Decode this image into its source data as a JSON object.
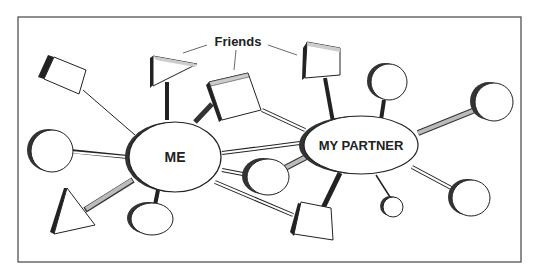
{
  "diagram": {
    "type": "social network diagram",
    "labels": {
      "me": "ME",
      "partner": "MY PARTNER",
      "friends": "Friends"
    },
    "nodes": [
      {
        "id": "me",
        "shape": "ellipse",
        "label": "ME"
      },
      {
        "id": "partner",
        "shape": "ellipse",
        "label": "MY PARTNER"
      },
      {
        "id": "friend-triangle-top",
        "shape": "triangle"
      },
      {
        "id": "friend-box-center",
        "shape": "box"
      },
      {
        "id": "friend-box-top-right",
        "shape": "box"
      },
      {
        "id": "box-top-left",
        "shape": "box"
      },
      {
        "id": "circle-left",
        "shape": "circle"
      },
      {
        "id": "triangle-bottom-left",
        "shape": "triangle"
      },
      {
        "id": "circle-below-me",
        "shape": "circle"
      },
      {
        "id": "circle-shared-middle",
        "shape": "circle"
      },
      {
        "id": "box-shared-bottom",
        "shape": "box"
      },
      {
        "id": "circle-top-partner",
        "shape": "circle"
      },
      {
        "id": "circle-right",
        "shape": "circle"
      },
      {
        "id": "small-circle-below-partner",
        "shape": "circle"
      },
      {
        "id": "circle-bottom-right",
        "shape": "circle"
      }
    ],
    "colors": {
      "stroke": "#222222",
      "background": "#ffffff",
      "shadow": "#333333",
      "link_gray": "#bbbbbb"
    }
  }
}
